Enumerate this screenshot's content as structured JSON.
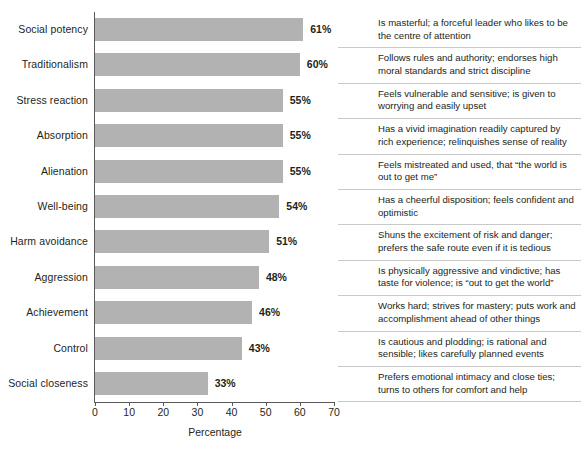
{
  "chart_data": {
    "type": "bar",
    "orientation": "horizontal",
    "title": "",
    "xlabel": "Percentage",
    "ylabel": "",
    "xlim": [
      0,
      70
    ],
    "xticks": [
      0,
      10,
      20,
      30,
      40,
      50,
      60,
      70
    ],
    "grid": false,
    "legend": null,
    "bar_color": "#b2b2b2",
    "axis_color": "#595959",
    "categories": [
      "Social potency",
      "Traditionalism",
      "Stress reaction",
      "Absorption",
      "Alienation",
      "Well-being",
      "Harm avoidance",
      "Aggression",
      "Achievement",
      "Control",
      "Social closeness"
    ],
    "values": [
      61,
      60,
      55,
      55,
      55,
      54,
      51,
      48,
      46,
      43,
      33
    ],
    "value_labels": [
      "61%",
      "60%",
      "55%",
      "55%",
      "55%",
      "54%",
      "51%",
      "48%",
      "46%",
      "43%",
      "33%"
    ],
    "descriptions": [
      "Is masterful; a forceful leader who likes to be the centre of attention",
      "Follows rules and authority; endorses high moral standards and strict discipline",
      "Feels vulnerable and sensitive; is given to worrying and easily upset",
      "Has a vivid imagination readily captured by rich experience; relinquishes sense of reality",
      "Feels mistreated and used, that “the world is out to get me”",
      "Has a cheerful disposition; feels confident and optimistic",
      "Shuns the excitement of risk and danger; prefers the safe route even if it is tedious",
      "Is physically aggressive and vindictive; has taste for violence; is “out to get the world”",
      "Works hard; strives for mastery; puts work and accomplishment ahead of other things",
      "Is cautious and plodding; is rational and sensible; likes carefully planned events",
      "Prefers emotional intimacy and close ties; turns to others for comfort and help"
    ]
  }
}
